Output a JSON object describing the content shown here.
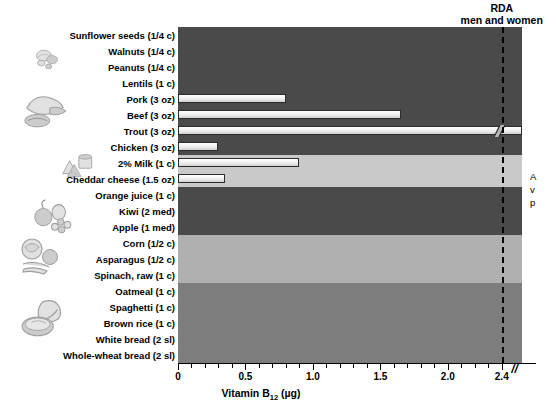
{
  "chart_data": {
    "type": "bar",
    "orientation": "horizontal",
    "title": "",
    "xlabel": "Vitamin B12 (µg)",
    "ylabel": "",
    "xlim": [
      0,
      2.55
    ],
    "xticks_major": [
      0,
      0.5,
      1.0,
      1.5,
      2.0,
      2.4
    ],
    "xticklabels": [
      "0",
      "0.5",
      "1.0",
      "1.5",
      "2.0",
      "2.4"
    ],
    "xtick_minor_step": 0.1,
    "grid": false,
    "legend": "none",
    "axis_break": true,
    "axis_break_symbol": "//",
    "reference_line": {
      "label_line1": "RDA",
      "label_line2": "men and women",
      "value": 2.4,
      "style": "dashed"
    },
    "categories": [
      "Sunflower seeds (1/4 c)",
      "Walnuts (1/4 c)",
      "Peanuts (1/4 c)",
      "Lentils (1 c)",
      "Pork (3 oz)",
      "Beef (3 oz)",
      "Trout (3 oz)",
      "Chicken (3 oz)",
      "2% Milk (1 c)",
      "Cheddar cheese (1.5 oz)",
      "Orange juice (1 c)",
      "Kiwi (2 med)",
      "Apple (1 med)",
      "Corn (1/2 c)",
      "Asparagus (1/2 c)",
      "Spinach, raw (1 c)",
      "Oatmeal (1 c)",
      "Spaghetti (1 c)",
      "Brown rice (1 c)",
      "White bread (2 sl)",
      "Whole-wheat bread (2 sl)"
    ],
    "values": [
      0,
      0,
      0,
      0,
      0.8,
      1.65,
      2.55,
      0.3,
      0.9,
      0.35,
      0,
      0,
      0,
      0,
      0,
      0,
      0,
      0,
      0,
      0,
      0
    ],
    "value_broken": [
      false,
      false,
      false,
      false,
      false,
      false,
      true,
      false,
      false,
      false,
      false,
      false,
      false,
      false,
      false,
      false,
      false,
      false,
      false,
      false,
      false
    ]
  },
  "rows": [
    {
      "label": "Sunflower seeds (1/4 c)",
      "value": 0,
      "group": "nuts"
    },
    {
      "label": "Walnuts (1/4 c)",
      "value": 0,
      "group": "nuts"
    },
    {
      "label": "Peanuts (1/4 c)",
      "value": 0,
      "group": "nuts"
    },
    {
      "label": "Lentils (1 c)",
      "value": 0,
      "group": "nuts"
    },
    {
      "label": "Pork (3 oz)",
      "value": 0.8,
      "group": "meat"
    },
    {
      "label": "Beef (3 oz)",
      "value": 1.65,
      "group": "meat"
    },
    {
      "label": "Trout (3 oz)",
      "value": 2.55,
      "group": "meat"
    },
    {
      "label": "Chicken (3 oz)",
      "value": 0.3,
      "group": "meat"
    },
    {
      "label": "2% Milk (1 c)",
      "value": 0.9,
      "group": "dairy"
    },
    {
      "label": "Cheddar cheese (1.5 oz)",
      "value": 0.35,
      "group": "dairy"
    },
    {
      "label": "Orange juice (1 c)",
      "value": 0,
      "group": "fruit"
    },
    {
      "label": "Kiwi (2 med)",
      "value": 0,
      "group": "fruit"
    },
    {
      "label": "Apple (1 med)",
      "value": 0,
      "group": "fruit"
    },
    {
      "label": "Corn (1/2 c)",
      "value": 0,
      "group": "veg"
    },
    {
      "label": "Asparagus (1/2 c)",
      "value": 0,
      "group": "veg"
    },
    {
      "label": "Spinach, raw (1 c)",
      "value": 0,
      "group": "veg"
    },
    {
      "label": "Oatmeal (1 c)",
      "value": 0,
      "group": "grain"
    },
    {
      "label": "Spaghetti (1 c)",
      "value": 0,
      "group": "grain"
    },
    {
      "label": "Brown rice (1 c)",
      "value": 0,
      "group": "grain"
    },
    {
      "label": "White bread (2 sl)",
      "value": 0,
      "group": "grain"
    },
    {
      "label": "Whole-wheat bread (2 sl)",
      "value": 0,
      "group": "grain"
    }
  ],
  "bands": [
    {
      "group": "nuts",
      "start": 0,
      "count": 4,
      "color": "#4a4a4a"
    },
    {
      "group": "meat",
      "start": 4,
      "count": 4,
      "color": "#4a4a4a"
    },
    {
      "group": "dairy",
      "start": 8,
      "count": 2,
      "color": "#c9c9c9"
    },
    {
      "group": "fruit",
      "start": 10,
      "count": 3,
      "color": "#4a4a4a"
    },
    {
      "group": "veg",
      "start": 13,
      "count": 3,
      "color": "#b0b0b0"
    },
    {
      "group": "grain",
      "start": 16,
      "count": 5,
      "color": "#7d7d7d"
    }
  ],
  "axis": {
    "title": "Vitamin B12 (µg)",
    "title_main": "Vitamin B",
    "title_sub": "12",
    "title_unit": " (µg)",
    "ticks": [
      {
        "value": 0,
        "label": "0"
      },
      {
        "value": 0.5,
        "label": "0.5"
      },
      {
        "value": 1.0,
        "label": "1.0"
      },
      {
        "value": 1.5,
        "label": "1.5"
      },
      {
        "value": 2.0,
        "label": "2.0"
      },
      {
        "value": 2.4,
        "label": "2.4"
      }
    ],
    "break_symbol": "//"
  },
  "rda": {
    "line1": "RDA",
    "line2": "men and women",
    "value": 2.4
  },
  "side_note": {
    "line1": "A",
    "line2": "v",
    "line3": "p"
  },
  "colors": {
    "band_dark": "#4a4a4a",
    "band_dairy": "#c9c9c9",
    "band_veg": "#b0b0b0",
    "band_grain": "#7d7d7d",
    "bar_fill": "#f2f2f2",
    "bar_edge": "#2b2b2b",
    "rda_line": "#000000"
  }
}
